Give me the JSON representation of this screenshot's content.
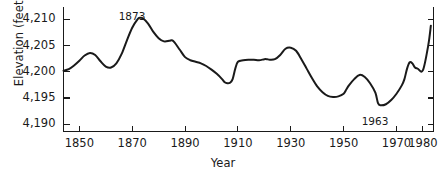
{
  "chart_data": {
    "type": "line",
    "title": "",
    "xlabel": "Year",
    "ylabel": "Elevation (feet)",
    "xlim": [
      1844,
      1984
    ],
    "ylim": [
      4188.6,
      4211.5
    ],
    "grid": false,
    "legend": null,
    "axis": {
      "x_ticks": [
        1850,
        1870,
        1890,
        1910,
        1930,
        1950,
        1970,
        1980
      ],
      "x_tick_labels": [
        "1850",
        "1870",
        "1890",
        "1910",
        "1930",
        "1950",
        "1970",
        "1980"
      ],
      "y_ticks": [
        4190,
        4195,
        4200,
        4205,
        4210
      ],
      "y_tick_labels": [
        "4,190",
        "4,195",
        "4,200",
        "4,205",
        "4,210"
      ],
      "tick_direction": "in",
      "spines": [
        "left",
        "bottom",
        "right"
      ]
    },
    "series": [
      {
        "name": "Great Salt Lake elevation",
        "color": "#1a1a1a",
        "line_width": 2.0,
        "x": [
          1844,
          1846,
          1848,
          1850,
          1852,
          1854,
          1856,
          1858,
          1860,
          1862,
          1864,
          1866,
          1868,
          1870,
          1872,
          1873,
          1874,
          1876,
          1878,
          1880,
          1882,
          1884,
          1885,
          1886,
          1888,
          1890,
          1892,
          1894,
          1896,
          1898,
          1900,
          1902,
          1904,
          1905,
          1906,
          1907,
          1908,
          1909,
          1910,
          1912,
          1914,
          1916,
          1918,
          1920,
          1921,
          1922,
          1924,
          1926,
          1928,
          1930,
          1932,
          1934,
          1936,
          1938,
          1940,
          1942,
          1944,
          1946,
          1948,
          1950,
          1951,
          1952,
          1954,
          1956,
          1958,
          1960,
          1962,
          1963,
          1964,
          1966,
          1968,
          1970,
          1972,
          1973,
          1974,
          1975,
          1976,
          1977,
          1978,
          1980,
          1982,
          1983
        ],
        "y": [
          4200.2,
          4200.5,
          4201.2,
          4202.1,
          4203.1,
          4203.6,
          4203.2,
          4202.0,
          4201.0,
          4200.8,
          4201.6,
          4203.4,
          4206.0,
          4208.4,
          4210.0,
          4210.3,
          4210.2,
          4209.2,
          4207.6,
          4206.4,
          4205.8,
          4205.9,
          4206.0,
          4205.6,
          4204.2,
          4202.8,
          4202.2,
          4201.9,
          4201.6,
          4201.1,
          4200.4,
          4199.6,
          4198.6,
          4198.0,
          4197.8,
          4197.9,
          4198.6,
          4200.6,
          4201.9,
          4202.2,
          4202.3,
          4202.3,
          4202.2,
          4202.4,
          4202.4,
          4202.3,
          4202.4,
          4203.2,
          4204.4,
          4204.6,
          4204.0,
          4202.4,
          4200.6,
          4198.8,
          4197.2,
          4196.1,
          4195.4,
          4195.2,
          4195.3,
          4195.8,
          4196.6,
          4197.4,
          4198.6,
          4199.4,
          4199.0,
          4197.8,
          4196.0,
          4194.0,
          4193.6,
          4193.8,
          4194.6,
          4195.8,
          4197.4,
          4198.6,
          4200.6,
          4201.8,
          4201.6,
          4200.8,
          4200.6,
          4200.3,
          4205.0,
          4208.8
        ]
      }
    ],
    "annotations": [
      {
        "label": "1873",
        "year": 1873,
        "value": 4210.3,
        "x_px": 132,
        "y_px": 10
      },
      {
        "label": "1963",
        "year": 1963,
        "value": 4194.0,
        "x_px": 375,
        "y_px": 115
      }
    ]
  }
}
